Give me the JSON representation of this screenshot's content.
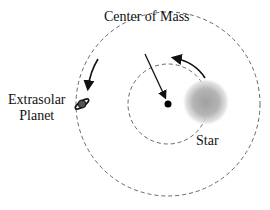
{
  "diagram": {
    "labels": {
      "center_of_mass": "Center of Mass",
      "planet_line1": "Extrasolar",
      "planet_line2": "Planet",
      "star": "Star"
    },
    "elements": {
      "outer_orbit": {
        "cx": 168,
        "cy": 104,
        "r": 92,
        "style": "dashed"
      },
      "inner_orbit": {
        "cx": 168,
        "cy": 104,
        "r": 40,
        "style": "dashed"
      },
      "center_of_mass_dot": {
        "cx": 168,
        "cy": 104,
        "r": 3.5
      },
      "star": {
        "cx": 205,
        "cy": 102,
        "r": 22
      },
      "planet": {
        "cx": 84,
        "cy": 106
      }
    },
    "colors": {
      "line": "#555555",
      "text": "#111111",
      "star_core": "#9a9a9a"
    }
  }
}
